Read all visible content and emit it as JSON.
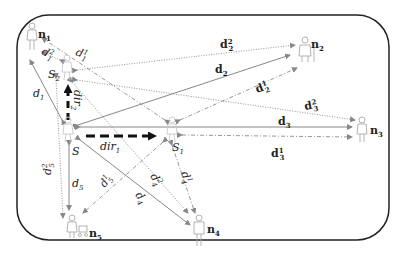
{
  "diagram": {
    "nodes": [
      {
        "id": "n1",
        "label": "n",
        "sub": "1",
        "x": 32,
        "y": 36
      },
      {
        "id": "n2",
        "label": "n",
        "sub": "2",
        "x": 305,
        "y": 50
      },
      {
        "id": "n3",
        "label": "n",
        "sub": "3",
        "x": 362,
        "y": 130
      },
      {
        "id": "n4",
        "label": "n",
        "sub": "4",
        "x": 199,
        "y": 235
      },
      {
        "id": "n5",
        "label": "n",
        "sub": "5",
        "x": 72,
        "y": 230
      },
      {
        "id": "S",
        "label": "S",
        "sub": "",
        "x": 68,
        "y": 133
      },
      {
        "id": "S1",
        "label": "S",
        "sub": "1",
        "x": 172,
        "y": 133
      },
      {
        "id": "S2",
        "label": "S",
        "sub": "2",
        "x": 67,
        "y": 68
      }
    ],
    "labels": {
      "d1": {
        "base": "d",
        "sub": "1",
        "sup": ""
      },
      "d2": {
        "base": "d",
        "sub": "2",
        "sup": ""
      },
      "d3": {
        "base": "d",
        "sub": "3",
        "sup": ""
      },
      "d4": {
        "base": "d",
        "sub": "4",
        "sup": ""
      },
      "d5": {
        "base": "d",
        "sub": "5",
        "sup": ""
      },
      "d11": {
        "base": "d",
        "sub": "1",
        "sup": "1"
      },
      "d21": {
        "base": "d",
        "sub": "1",
        "sup": "2"
      },
      "d22": {
        "base": "d",
        "sub": "2",
        "sup": "2"
      },
      "d12": {
        "base": "d",
        "sub": "2",
        "sup": "1"
      },
      "d23": {
        "base": "d",
        "sub": "3",
        "sup": "2"
      },
      "d13": {
        "base": "d",
        "sub": "3",
        "sup": "1"
      },
      "d24": {
        "base": "d",
        "sub": "4",
        "sup": "2"
      },
      "d14": {
        "base": "d",
        "sub": "4",
        "sup": "1"
      },
      "d25": {
        "base": "d",
        "sub": "5",
        "sup": "2"
      },
      "d15": {
        "base": "d",
        "sub": "5",
        "sup": "1"
      },
      "dir1": {
        "base": "dir",
        "sub": "1"
      },
      "dir2": {
        "base": "dir",
        "sub": "2"
      }
    },
    "edges": [
      {
        "from": "S",
        "to": "n1",
        "style": "solid",
        "label": "d1"
      },
      {
        "from": "S",
        "to": "n2",
        "style": "solid",
        "label": "d2"
      },
      {
        "from": "S",
        "to": "n3",
        "style": "solid",
        "label": "d3"
      },
      {
        "from": "S",
        "to": "n4",
        "style": "solid",
        "label": "d4"
      },
      {
        "from": "S",
        "to": "n5",
        "style": "solid",
        "label": "d5"
      },
      {
        "from": "S1",
        "to": "n1",
        "style": "dashdot",
        "label": "d11"
      },
      {
        "from": "S1",
        "to": "n2",
        "style": "dashdot",
        "label": "d12"
      },
      {
        "from": "S1",
        "to": "n3",
        "style": "dashdot",
        "label": "d13"
      },
      {
        "from": "S1",
        "to": "n4",
        "style": "dashdot",
        "label": "d14"
      },
      {
        "from": "S1",
        "to": "n5",
        "style": "dashdot",
        "label": "d15"
      },
      {
        "from": "S2",
        "to": "n1",
        "style": "dotted",
        "label": "d21"
      },
      {
        "from": "S2",
        "to": "n2",
        "style": "dotted",
        "label": "d22"
      },
      {
        "from": "S2",
        "to": "n3",
        "style": "dotted",
        "label": "d23"
      },
      {
        "from": "S2",
        "to": "n4",
        "style": "dotted",
        "label": "d24"
      },
      {
        "from": "S2",
        "to": "n5",
        "style": "dotted",
        "label": "d25"
      }
    ],
    "directions": [
      {
        "from": "S",
        "to": "S1",
        "label": "dir1"
      },
      {
        "from": "S",
        "to": "S2",
        "label": "dir2"
      }
    ],
    "colors": {
      "frame": "#222222",
      "line": "#777777",
      "dir_arrow": "#111111",
      "person": "#aaaaaa"
    }
  }
}
